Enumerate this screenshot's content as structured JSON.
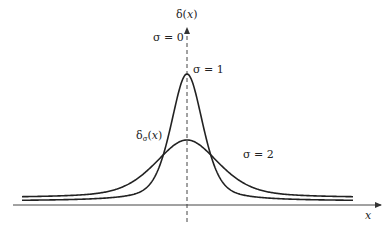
{
  "diagram": {
    "y_axis_label": {
      "prefix": "δ(",
      "var": "x",
      "suffix": ")"
    },
    "x_axis_label": "x",
    "curve_family_label": {
      "base": "δ",
      "sub": "σ",
      "open": "(",
      "var": "x",
      "close": ")"
    },
    "labels": {
      "sigma0": "σ = 0",
      "sigma1": "σ = 1",
      "sigma2": "σ = 2"
    },
    "colors": {
      "curve": "#222222",
      "axis": "#444444",
      "text": "#222222"
    },
    "curves": [
      {
        "name": "sigma-1",
        "peak_x": 187,
        "peak_y": 74,
        "width": 19
      },
      {
        "name": "sigma-2",
        "peak_x": 187,
        "peak_y": 140,
        "width": 38
      }
    ]
  }
}
